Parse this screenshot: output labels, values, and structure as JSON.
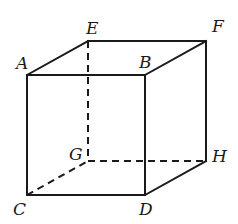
{
  "figure": {
    "type": "cube",
    "width": 238,
    "height": 224,
    "stroke_color": "#1a1a1a",
    "vertices": {
      "A": {
        "x": 27,
        "y": 75,
        "label_x": 16,
        "label_y": 69
      },
      "B": {
        "x": 145,
        "y": 75,
        "label_x": 139,
        "label_y": 68
      },
      "C": {
        "x": 27,
        "y": 195,
        "label_x": 13,
        "label_y": 215
      },
      "D": {
        "x": 145,
        "y": 195,
        "label_x": 139,
        "label_y": 215
      },
      "E": {
        "x": 88,
        "y": 41,
        "label_x": 86,
        "label_y": 34
      },
      "F": {
        "x": 206,
        "y": 41,
        "label_x": 212,
        "label_y": 32
      },
      "G": {
        "x": 88,
        "y": 161,
        "label_x": 69,
        "label_y": 160
      },
      "H": {
        "x": 206,
        "y": 161,
        "label_x": 212,
        "label_y": 162
      }
    },
    "labels": [
      "A",
      "B",
      "C",
      "D",
      "E",
      "F",
      "G",
      "H"
    ],
    "visible_edges": [
      [
        "A",
        "B"
      ],
      [
        "A",
        "C"
      ],
      [
        "B",
        "D"
      ],
      [
        "C",
        "D"
      ],
      [
        "A",
        "E"
      ],
      [
        "E",
        "F"
      ],
      [
        "B",
        "F"
      ],
      [
        "F",
        "H"
      ],
      [
        "D",
        "H"
      ]
    ],
    "hidden_edges": [
      [
        "E",
        "G"
      ],
      [
        "G",
        "H"
      ],
      [
        "C",
        "G"
      ]
    ]
  }
}
